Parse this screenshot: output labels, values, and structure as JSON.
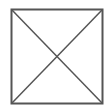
{
  "figure": {
    "shape": "square-with-diagonal-cross",
    "icon": "image-placeholder-icon",
    "stroke_color": "#555555",
    "background_color": "#ffffff"
  }
}
